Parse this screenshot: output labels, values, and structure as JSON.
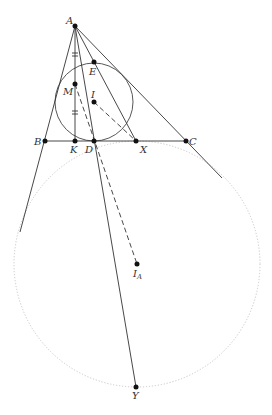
{
  "diagram": {
    "points": {
      "A": {
        "label": "A",
        "x": 75,
        "y": 26
      },
      "B": {
        "label": "B",
        "x": 45,
        "y": 141
      },
      "C": {
        "label": "C",
        "x": 186,
        "y": 141
      },
      "D": {
        "label": "D",
        "x": 94,
        "y": 141
      },
      "E": {
        "label": "E",
        "x": 94,
        "y": 62
      },
      "I": {
        "label": "I",
        "x": 94,
        "y": 102
      },
      "IA": {
        "label": "I",
        "sub": "A",
        "x": 137,
        "y": 264
      },
      "K": {
        "label": "K",
        "x": 75,
        "y": 141
      },
      "M": {
        "label": "M",
        "x": 75,
        "y": 84
      },
      "X": {
        "label": "X",
        "x": 136,
        "y": 141
      },
      "Y": {
        "label": "Y",
        "x": 136,
        "y": 387
      }
    },
    "circles": [
      {
        "name": "incircle",
        "center": "I",
        "r": 39,
        "style": "solid"
      },
      {
        "name": "A-excircle",
        "center": "IA",
        "r": 123,
        "style": "dotted"
      }
    ],
    "segments": [
      {
        "from": "A",
        "to": "B-extended",
        "style": "solid"
      },
      {
        "from": "A",
        "to": "C-extended",
        "style": "solid"
      },
      {
        "from": "B",
        "to": "C",
        "style": "solid"
      },
      {
        "from": "A",
        "to": "K",
        "style": "solid"
      },
      {
        "from": "A",
        "to": "X",
        "style": "solid"
      },
      {
        "from": "A",
        "to": "Y",
        "style": "solid"
      },
      {
        "from": "M",
        "to": "IA",
        "style": "dashed"
      },
      {
        "from": "I",
        "to": "X",
        "style": "dashed"
      }
    ],
    "tick_marks": [
      "AM double tick",
      "MK double tick"
    ]
  }
}
